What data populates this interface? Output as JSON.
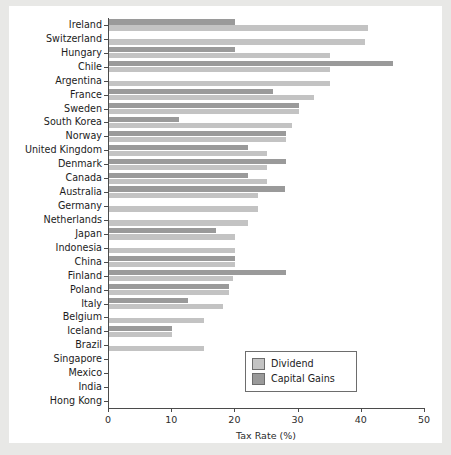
{
  "chart_data": {
    "type": "bar",
    "orientation": "horizontal",
    "title": "",
    "xlabel": "Tax Rate (%)",
    "ylabel": "",
    "xlim": [
      0,
      50
    ],
    "xticks": [
      0,
      10,
      20,
      30,
      40,
      50
    ],
    "grid": false,
    "legend_position": "bottom-right",
    "categories": [
      "Ireland",
      "Switzerland",
      "Hungary",
      "Chile",
      "Argentina",
      "France",
      "Sweden",
      "South Korea",
      "Norway",
      "United Kingdom",
      "Denmark",
      "Canada",
      "Australia",
      "Germany",
      "Netherlands",
      "Japan",
      "Indonesia",
      "China",
      "Finland",
      "Poland",
      "Italy",
      "Belgium",
      "Iceland",
      "Brazil",
      "Singapore",
      "Mexico",
      "India",
      "Hong Kong"
    ],
    "series": [
      {
        "name": "Dividend",
        "color": "#c3c3c3",
        "values": [
          41.0,
          40.5,
          35.0,
          35.0,
          35.0,
          32.5,
          30.0,
          29.0,
          28.0,
          25.0,
          25.0,
          25.0,
          23.6,
          23.6,
          22.0,
          20.0,
          20.0,
          20.0,
          19.6,
          19.0,
          18.0,
          15.0,
          10.0,
          15.0,
          0,
          0,
          0,
          0
        ]
      },
      {
        "name": "Capital Gains",
        "color": "#9a9a9a",
        "values": [
          20.0,
          0,
          20.0,
          45.0,
          0,
          26.0,
          30.0,
          11.0,
          28.0,
          22.0,
          28.0,
          22.0,
          27.8,
          0,
          0,
          17.0,
          0,
          20.0,
          28.0,
          19.0,
          12.5,
          0,
          10.0,
          0,
          0,
          0,
          0,
          0
        ]
      }
    ]
  },
  "legend": {
    "items": [
      {
        "label": "Dividend"
      },
      {
        "label": "Capital Gains"
      }
    ]
  },
  "axis": {
    "x_title": "Tax Rate (%)",
    "tick_labels": [
      "0",
      "10",
      "20",
      "30",
      "40",
      "50"
    ]
  }
}
